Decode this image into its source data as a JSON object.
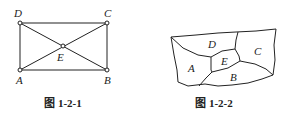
{
  "figures": [
    {
      "caption": "图 1-2-1",
      "labels": {
        "A": "A",
        "B": "B",
        "C": "C",
        "D": "D",
        "E": "E"
      }
    },
    {
      "caption": "图 1-2-2",
      "labels": {
        "A": "A",
        "B": "B",
        "C": "C",
        "D": "D",
        "E": "E"
      }
    }
  ]
}
